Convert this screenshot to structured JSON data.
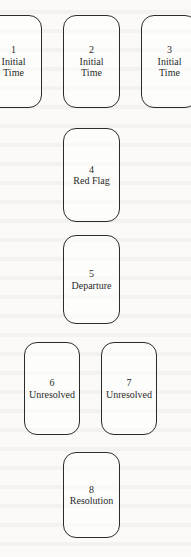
{
  "diagram": {
    "type": "card-spread-layout",
    "cards": [
      {
        "number": "1",
        "label": "Initial\nTime"
      },
      {
        "number": "2",
        "label": "Initial\nTime"
      },
      {
        "number": "3",
        "label": "Initial\nTime"
      },
      {
        "number": "4",
        "label": "Red Flag"
      },
      {
        "number": "5",
        "label": "Departure"
      },
      {
        "number": "6",
        "label": "Unresolved"
      },
      {
        "number": "7",
        "label": "Unresolved"
      },
      {
        "number": "8",
        "label": "Resolution"
      }
    ]
  }
}
